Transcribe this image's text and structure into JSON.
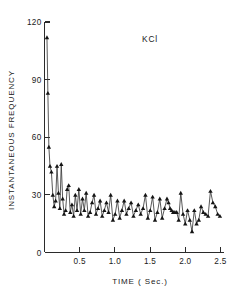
{
  "chart_data": {
    "type": "line",
    "title": "",
    "annotation": "KCl",
    "xlabel": "TIME ( Sec.)",
    "ylabel": "INSTANTANEOUS FREQUENCY",
    "xlim": [
      0,
      2.55
    ],
    "ylim": [
      0,
      120
    ],
    "xticks": [
      0.5,
      1.0,
      1.5,
      2.0,
      2.5
    ],
    "xticklabels": [
      "0.5",
      "1.0",
      "1.5",
      "2.0",
      "2.5"
    ],
    "yticks": [
      0,
      30,
      60,
      90,
      120
    ],
    "yticklabels": [
      "0",
      "30",
      "60",
      "90",
      "120"
    ],
    "grid": false,
    "legend": false,
    "marker": "triangle-up",
    "series": [
      {
        "name": "instantaneous frequency",
        "x": [
          0.035,
          0.048,
          0.062,
          0.078,
          0.098,
          0.118,
          0.138,
          0.158,
          0.178,
          0.198,
          0.218,
          0.238,
          0.258,
          0.278,
          0.3,
          0.322,
          0.344,
          0.366,
          0.39,
          0.414,
          0.438,
          0.462,
          0.488,
          0.514,
          0.54,
          0.566,
          0.592,
          0.62,
          0.648,
          0.676,
          0.704,
          0.732,
          0.76,
          0.79,
          0.82,
          0.85,
          0.88,
          0.91,
          0.94,
          0.972,
          1.004,
          1.036,
          1.068,
          1.1,
          1.132,
          1.164,
          1.196,
          1.23,
          1.264,
          1.298,
          1.332,
          1.366,
          1.4,
          1.434,
          1.468,
          1.502,
          1.536,
          1.57,
          1.604,
          1.638,
          1.672,
          1.706,
          1.74,
          1.762,
          1.784,
          1.806,
          1.828,
          1.852,
          1.878,
          1.906,
          1.936,
          1.968,
          2.0,
          2.032,
          2.064,
          2.096,
          2.128,
          2.16,
          2.192,
          2.224,
          2.256,
          2.29,
          2.324,
          2.358,
          2.392,
          2.426,
          2.46,
          2.492
        ],
        "values": [
          112,
          83,
          55,
          45,
          42,
          30,
          24,
          27,
          45,
          31,
          23,
          46,
          28,
          20,
          22,
          33,
          35,
          21,
          25,
          19,
          30,
          22,
          33,
          20,
          28,
          22,
          31,
          19,
          21,
          26,
          30,
          20,
          23,
          27,
          19,
          22,
          26,
          21,
          30,
          17,
          20,
          27,
          18,
          22,
          27,
          20,
          23,
          26,
          19,
          22,
          25,
          20,
          23,
          30,
          18,
          22,
          29,
          17,
          21,
          28,
          18,
          23,
          28,
          26,
          23,
          22,
          21,
          21,
          21,
          17,
          31,
          20,
          15,
          22,
          17,
          11,
          22,
          15,
          17,
          24,
          21,
          20,
          19,
          32,
          26,
          24,
          20,
          19
        ]
      }
    ]
  }
}
